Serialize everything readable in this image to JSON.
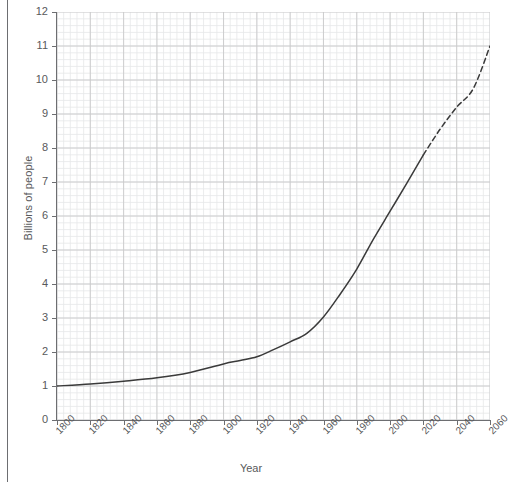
{
  "figure": {
    "ylabel": "Billions of people",
    "xlabel": "Year"
  },
  "chart_data": {
    "type": "line",
    "title": "",
    "subtitle": "",
    "xlabel": "Year",
    "ylabel": "Billions of people",
    "xlim": [
      1800,
      2060
    ],
    "ylim": [
      0,
      12
    ],
    "xticks": [
      1800,
      1820,
      1840,
      1860,
      1880,
      1900,
      1920,
      1940,
      1960,
      1980,
      2000,
      2020,
      2040,
      2060
    ],
    "xtick_labels": [
      "1800",
      "1820",
      "1840",
      "1860",
      "1880",
      "1900",
      "1920",
      "1940",
      "1960",
      "1980",
      "2000",
      "2020",
      "2040",
      "2060"
    ],
    "yticks": [
      0,
      1,
      2,
      3,
      4,
      5,
      6,
      7,
      8,
      9,
      10,
      11,
      12
    ],
    "ytick_labels": [
      "0",
      "1",
      "2",
      "3",
      "4",
      "5",
      "6",
      "7",
      "8",
      "9",
      "10",
      "11",
      "12"
    ],
    "grid": true,
    "grid_major_step_x": 20,
    "grid_major_step_y": 1,
    "grid_minor_divisions": 5,
    "legend": null,
    "legend_position": "none",
    "line_color": "#3a3a3a",
    "grid_color": "#c9cacb",
    "minor_grid_color": "#e6e7e8",
    "axis_color": "#6d6e71",
    "series": [
      {
        "name": "Observed population",
        "style": "solid",
        "x": [
          1800,
          1820,
          1840,
          1860,
          1880,
          1900,
          1910,
          1920,
          1930,
          1940,
          1950,
          1960,
          1970,
          1980,
          1990,
          2000,
          2010,
          2020
        ],
        "values": [
          1.0,
          1.06,
          1.14,
          1.24,
          1.4,
          1.65,
          1.75,
          1.86,
          2.07,
          2.3,
          2.55,
          3.03,
          3.7,
          4.44,
          5.32,
          6.14,
          6.96,
          7.8
        ]
      },
      {
        "name": "Projected population",
        "style": "dashed",
        "x": [
          2020,
          2030,
          2040,
          2050,
          2060
        ],
        "values": [
          7.8,
          8.55,
          9.2,
          9.75,
          11.0
        ]
      }
    ]
  }
}
